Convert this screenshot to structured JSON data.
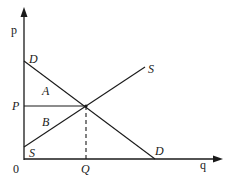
{
  "diagram": {
    "type": "supply-demand",
    "axes": {
      "y_label": "p",
      "x_label": "q",
      "origin_label": "0"
    },
    "curves": {
      "demand": {
        "label_top": "D",
        "label_bottom": "D"
      },
      "supply": {
        "label_top": "S",
        "label_bottom": "S"
      }
    },
    "equilibrium": {
      "price_label": "P",
      "quantity_label": "Q"
    },
    "regions": {
      "consumer_surplus": "A",
      "producer_surplus": "B"
    },
    "colors": {
      "line": "#1a1a1a",
      "background": "#ffffff"
    }
  }
}
